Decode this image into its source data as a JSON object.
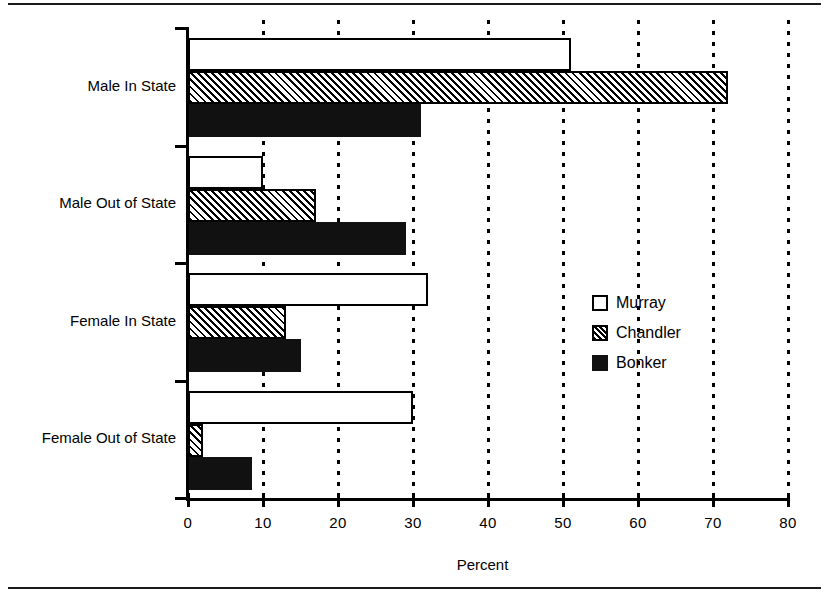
{
  "chart_data": {
    "type": "bar",
    "orientation": "horizontal",
    "title": "",
    "xlabel": "Percent",
    "ylabel": "",
    "xlim": [
      0,
      80
    ],
    "xticks": [
      0,
      10,
      20,
      30,
      40,
      50,
      60,
      70,
      80
    ],
    "xtick_labels": [
      "0",
      "10",
      "20",
      "30",
      "40",
      "50",
      "60",
      "70",
      "80"
    ],
    "grid": "vertical-dashed",
    "legend_position": "center-right",
    "categories": [
      "Male In State",
      "Male Out of State",
      "Female In State",
      "Female Out of State"
    ],
    "series": [
      {
        "name": "Murray",
        "fill": "white",
        "values": [
          51,
          10,
          32,
          30
        ]
      },
      {
        "name": "Chandler",
        "fill": "hatch",
        "values": [
          72,
          17,
          13,
          2
        ]
      },
      {
        "name": "Bonker",
        "fill": "black",
        "values": [
          31,
          29,
          15,
          8.5
        ]
      }
    ]
  },
  "legend": {
    "items": [
      {
        "label": "Murray",
        "swatch": "white-square-icon"
      },
      {
        "label": "Chandler",
        "swatch": "hatched-square-icon"
      },
      {
        "label": "Bonker",
        "swatch": "black-square-icon"
      }
    ]
  },
  "colors": {
    "ink": "#000000",
    "bar_fill_murray": "#ffffff",
    "bar_fill_bonker": "#111111",
    "background": "#ffffff"
  }
}
